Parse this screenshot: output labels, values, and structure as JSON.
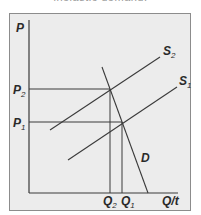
{
  "caption": "inelastic demand.",
  "diagram": {
    "y_axis_label": "P",
    "x_axis_label": "Q/t",
    "price_levels": [
      {
        "name": "P",
        "sub": "2",
        "y": 89
      },
      {
        "name": "P",
        "sub": "1",
        "y": 122
      }
    ],
    "quantity_levels": [
      {
        "name": "Q",
        "sub": "2",
        "x": 110
      },
      {
        "name": "Q",
        "sub": "1",
        "x": 122
      }
    ],
    "curves": [
      {
        "name": "S",
        "sub": "2",
        "type": "supply",
        "from": [
          50,
          130
        ],
        "to": [
          160,
          57
        ]
      },
      {
        "name": "S",
        "sub": "1",
        "type": "supply",
        "from": [
          68,
          160
        ],
        "to": [
          177,
          87
        ]
      },
      {
        "name": "D",
        "sub": "",
        "type": "demand",
        "from": [
          102,
          67
        ],
        "to": [
          148,
          193
        ]
      }
    ],
    "colors": {
      "background": "#ececec",
      "line": "#3a3a3a",
      "frame": "#8c8c8c"
    }
  }
}
